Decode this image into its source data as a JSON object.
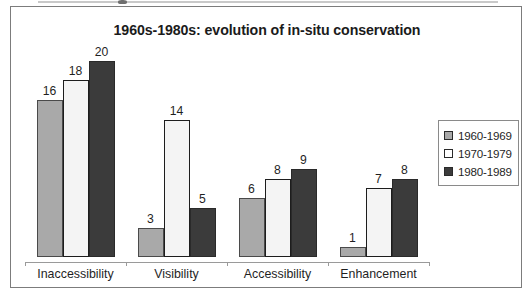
{
  "chart_data": {
    "type": "bar",
    "title": "1960s-1980s: evolution of in-situ conservation",
    "xlabel": "",
    "ylabel": "",
    "ylim": [
      0,
      21
    ],
    "grid": false,
    "legend_position": "right",
    "categories": [
      "Inaccessibility",
      "Visibility",
      "Accessibility",
      "Enhancement"
    ],
    "series": [
      {
        "name": "1960-1969",
        "color": "#a9a9a9",
        "values": [
          16,
          3,
          6,
          1
        ]
      },
      {
        "name": "1970-1979",
        "color": "#f4f4f4",
        "values": [
          18,
          14,
          8,
          7
        ]
      },
      {
        "name": "1980-1989",
        "color": "#3b3b3b",
        "values": [
          20,
          5,
          9,
          8
        ]
      }
    ],
    "data_labels": [
      [
        "16",
        "18",
        "20"
      ],
      [
        "3",
        "14",
        "5"
      ],
      [
        "6",
        "8",
        "9"
      ],
      [
        "1",
        "7",
        "8"
      ]
    ]
  },
  "legend": {
    "items": [
      {
        "label": "1960-1969",
        "swatch": "legend-swatch-1960s"
      },
      {
        "label": "1970-1979",
        "swatch": "legend-swatch-1970s"
      },
      {
        "label": "1980-1989",
        "swatch": "legend-swatch-1980s"
      }
    ]
  }
}
